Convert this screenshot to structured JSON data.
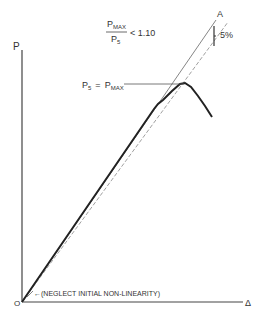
{
  "diagram": {
    "axes": {
      "y_label": "P",
      "x_label": "Δ",
      "origin_label": "O"
    },
    "criterion": {
      "numerator": "P",
      "numerator_sub": "MAX",
      "denominator": "P",
      "denominator_sub": "5",
      "relation": "< 1.10"
    },
    "point_a_label": "A",
    "offset_label": "5%",
    "peak_label": {
      "lhs": "P",
      "lhs_sub": "5",
      "eq": "=",
      "rhs": "P",
      "rhs_sub": "MAX"
    },
    "note": "←(NEGLECT INITIAL NON-LINEARITY)",
    "colors": {
      "ink": "#333333",
      "background": "#ffffff"
    }
  }
}
